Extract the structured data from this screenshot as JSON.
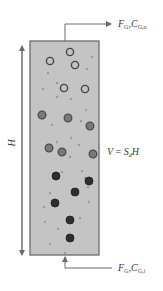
{
  "diagram": {
    "type": "bubble-column-reactor",
    "column": {
      "fill_color": "#c4c4c4",
      "border_color": "#6a6a6a",
      "x": 30,
      "y": 41,
      "width": 69,
      "height": 214
    },
    "height_label": "H",
    "volume_label": {
      "lhs": "V",
      "eq": " = ",
      "s": "S",
      "s_sub": "d",
      "h": "H"
    },
    "outlet": {
      "f_symbol": "F",
      "f_sub": "G",
      "sep": ",",
      "c_symbol": "C",
      "c_sub": "G,o"
    },
    "inlet": {
      "f_symbol": "F",
      "f_sub": "G",
      "sep": ",",
      "c_symbol": "C",
      "c_sub": "G,i"
    },
    "colors": {
      "line": "#6a6a6a",
      "hollow_bubble": "#444444",
      "gray_bubble_fill": "#7a7a7a",
      "dark_bubble_fill": "#2e2e2e",
      "small_dot": "#9a9a9a"
    },
    "bubbles": {
      "hollow": [
        [
          70,
          52
        ],
        [
          50,
          61
        ],
        [
          75,
          65
        ],
        [
          64,
          88
        ],
        [
          85,
          89
        ]
      ],
      "gray": [
        [
          42,
          115
        ],
        [
          68,
          118
        ],
        [
          90,
          126
        ],
        [
          49,
          148
        ],
        [
          62,
          152
        ],
        [
          93,
          154
        ]
      ],
      "dark": [
        [
          56,
          176
        ],
        [
          89,
          181
        ],
        [
          75,
          192
        ],
        [
          55,
          203
        ],
        [
          70,
          220
        ],
        [
          70,
          238
        ]
      ],
      "small": [
        [
          92,
          57
        ],
        [
          87,
          69
        ],
        [
          48,
          73
        ],
        [
          57,
          83
        ],
        [
          43,
          89
        ],
        [
          57,
          97
        ],
        [
          71,
          99
        ],
        [
          86,
          110
        ],
        [
          81,
          121
        ],
        [
          52,
          125
        ],
        [
          71,
          138
        ],
        [
          57,
          142
        ],
        [
          79,
          145
        ],
        [
          70,
          157
        ],
        [
          62,
          172
        ],
        [
          82,
          171
        ],
        [
          85,
          178
        ],
        [
          50,
          193
        ],
        [
          88,
          187
        ],
        [
          89,
          202
        ],
        [
          44,
          207
        ],
        [
          45,
          222
        ],
        [
          80,
          218
        ],
        [
          58,
          229
        ],
        [
          50,
          244
        ],
        [
          65,
          253
        ]
      ]
    }
  }
}
